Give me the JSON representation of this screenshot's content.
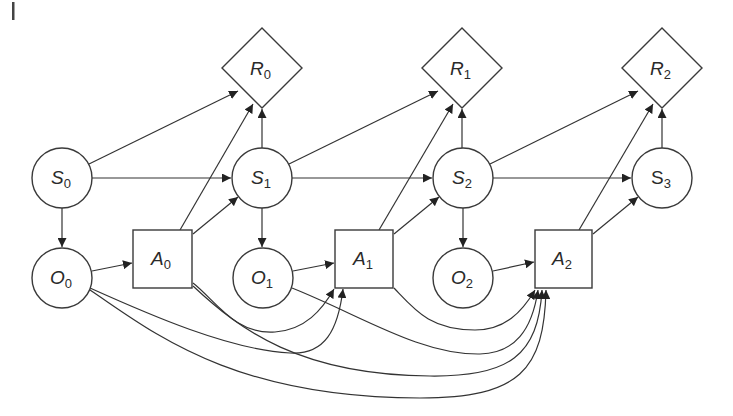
{
  "diagram": {
    "type": "dynamic decision network (POMDP unrolled over time)",
    "corner_mark": "|",
    "colors": {
      "stroke": "#3a3a3a",
      "background": "#ffffff",
      "text": "#2a2a2a"
    },
    "nodes": [
      {
        "id": "S0",
        "base": "S",
        "sub": "0",
        "shape": "circle",
        "role": "state",
        "cx": 62,
        "cy": 178
      },
      {
        "id": "S1",
        "base": "S",
        "sub": "1",
        "shape": "circle",
        "role": "state",
        "cx": 262,
        "cy": 178
      },
      {
        "id": "S2",
        "base": "S",
        "sub": "2",
        "shape": "circle",
        "role": "state",
        "cx": 463,
        "cy": 178
      },
      {
        "id": "S3",
        "base": "S",
        "sub": "3",
        "shape": "circle",
        "role": "state",
        "cx": 662,
        "cy": 178
      },
      {
        "id": "R0",
        "base": "R",
        "sub": "0",
        "shape": "diamond",
        "role": "reward",
        "cx": 262,
        "cy": 68
      },
      {
        "id": "R1",
        "base": "R",
        "sub": "1",
        "shape": "diamond",
        "role": "reward",
        "cx": 462,
        "cy": 68
      },
      {
        "id": "R2",
        "base": "R",
        "sub": "2",
        "shape": "diamond",
        "role": "reward",
        "cx": 662,
        "cy": 68
      },
      {
        "id": "O0",
        "base": "O",
        "sub": "0",
        "shape": "circle",
        "role": "observation",
        "cx": 62,
        "cy": 278
      },
      {
        "id": "O1",
        "base": "O",
        "sub": "1",
        "shape": "circle",
        "role": "observation",
        "cx": 263,
        "cy": 278
      },
      {
        "id": "O2",
        "base": "O",
        "sub": "2",
        "shape": "circle",
        "role": "observation",
        "cx": 463,
        "cy": 278
      },
      {
        "id": "A0",
        "base": "A",
        "sub": "0",
        "shape": "square",
        "role": "action",
        "cx": 162,
        "cy": 259
      },
      {
        "id": "A1",
        "base": "A",
        "sub": "1",
        "shape": "square",
        "role": "action",
        "cx": 364,
        "cy": 259
      },
      {
        "id": "A2",
        "base": "A",
        "sub": "2",
        "shape": "square",
        "role": "action",
        "cx": 564,
        "cy": 259
      }
    ],
    "edges": [
      {
        "from": "S0",
        "to": "R0"
      },
      {
        "from": "S0",
        "to": "S1"
      },
      {
        "from": "S0",
        "to": "O0"
      },
      {
        "from": "O0",
        "to": "A0"
      },
      {
        "from": "A0",
        "to": "R0"
      },
      {
        "from": "A0",
        "to": "S1"
      },
      {
        "from": "S1",
        "to": "R0"
      },
      {
        "from": "S1",
        "to": "R1"
      },
      {
        "from": "S1",
        "to": "S2"
      },
      {
        "from": "S1",
        "to": "O1"
      },
      {
        "from": "O1",
        "to": "A1"
      },
      {
        "from": "A1",
        "to": "R1"
      },
      {
        "from": "A1",
        "to": "S2"
      },
      {
        "from": "S2",
        "to": "R1"
      },
      {
        "from": "S2",
        "to": "R2"
      },
      {
        "from": "S2",
        "to": "S3"
      },
      {
        "from": "S2",
        "to": "O2"
      },
      {
        "from": "O2",
        "to": "A2"
      },
      {
        "from": "A2",
        "to": "R2"
      },
      {
        "from": "A2",
        "to": "S3"
      },
      {
        "from": "S3",
        "to": "R2"
      },
      {
        "from": "A0",
        "to": "A1",
        "curved": true
      },
      {
        "from": "O0",
        "to": "A1",
        "curved": true
      },
      {
        "from": "A1",
        "to": "A2",
        "curved": true
      },
      {
        "from": "O1",
        "to": "A2",
        "curved": true
      },
      {
        "from": "A0",
        "to": "A2",
        "curved": true
      },
      {
        "from": "O0",
        "to": "A2",
        "curved": true
      }
    ]
  }
}
